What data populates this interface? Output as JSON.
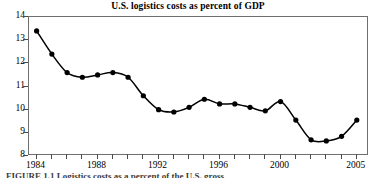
{
  "chart": {
    "title": "U.S. logistics costs as percent of GDP",
    "caption": "FIGURE 1.1 Logistics costs as a percent of the U.S. gross",
    "line_color": "#000000",
    "marker_color": "#000000",
    "frame_color": "#6f6f6f",
    "background_color": "#ffffff"
  },
  "chart_data": {
    "type": "line",
    "title": "U.S. logistics costs as percent of GDP",
    "xlabel": "",
    "ylabel": "",
    "grid": false,
    "legend": "none",
    "xlim": [
      1983.5,
      2005.8
    ],
    "ylim": [
      8,
      14
    ],
    "x_tick_labels": [
      "1984",
      "1988",
      "1992",
      "1996",
      "2000",
      "2005"
    ],
    "x_tick_values": [
      1984,
      1988,
      1992,
      1996,
      2000,
      2005
    ],
    "x_minor_tick_values": [
      1984,
      1985,
      1986,
      1987,
      1988,
      1989,
      1990,
      1991,
      1992,
      1993,
      1994,
      1995,
      1996,
      1997,
      1998,
      1999,
      2000,
      2001,
      2002,
      2003,
      2004,
      2005
    ],
    "y_tick_labels": [
      "8",
      "9",
      "10",
      "11",
      "12",
      "13",
      "14"
    ],
    "y_tick_values": [
      8,
      9,
      10,
      11,
      12,
      13,
      14
    ],
    "x": [
      1984,
      1985,
      1986,
      1987,
      1988,
      1989,
      1990,
      1991,
      1992,
      1993,
      1994,
      1995,
      1996,
      1997,
      1998,
      1999,
      2000,
      2001,
      2002,
      2003,
      2004,
      2005
    ],
    "series": [
      {
        "name": "U.S. logistics costs as percent of GDP",
        "values": [
          13.4,
          12.4,
          11.6,
          11.4,
          11.5,
          11.6,
          11.4,
          10.6,
          10.0,
          9.9,
          10.1,
          10.45,
          10.25,
          10.25,
          10.1,
          9.95,
          10.35,
          9.55,
          8.7,
          8.65,
          8.85,
          9.55
        ]
      }
    ]
  }
}
